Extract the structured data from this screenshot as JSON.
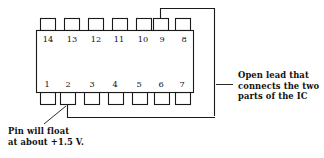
{
  "figure": {
    "type": "ic-dip-package-diagram",
    "package": "14-pin DIP integrated circuit",
    "colors": {
      "background": "#ffffff",
      "outline": "#1a1a1a",
      "text": "#111111",
      "wire": "#1a1a1a"
    }
  },
  "ic": {
    "top_pins": [
      {
        "number": "14"
      },
      {
        "number": "13"
      },
      {
        "number": "12"
      },
      {
        "number": "11"
      },
      {
        "number": "10"
      },
      {
        "number": "9"
      },
      {
        "number": "8"
      }
    ],
    "bottom_pins": [
      {
        "number": "1"
      },
      {
        "number": "2"
      },
      {
        "number": "3"
      },
      {
        "number": "4"
      },
      {
        "number": "5"
      },
      {
        "number": "6"
      },
      {
        "number": "7"
      }
    ]
  },
  "wires": {
    "open_lead": {
      "from_pin": "9",
      "to_pin": "2",
      "style": "open"
    }
  },
  "annotations": {
    "right": {
      "lines": [
        "Open lead that",
        "connects the two",
        "parts of the IC"
      ]
    },
    "bottom_left": {
      "lines": [
        "Pin will float",
        "at about +1.5 V."
      ]
    }
  }
}
